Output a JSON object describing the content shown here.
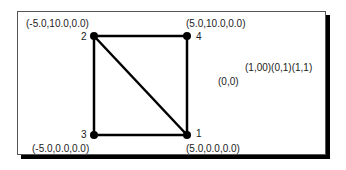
{
  "diagram": {
    "title": "",
    "nodes": [
      {
        "id": "1",
        "label": "1",
        "coords": "(5.0,0.0,0.0)",
        "x": 187,
        "y": 135
      },
      {
        "id": "2",
        "label": "2",
        "coords": "(-5.0,10.0,0.0)",
        "x": 94,
        "y": 36
      },
      {
        "id": "3",
        "label": "3",
        "coords": "(-5.0,0.0,0.0)",
        "x": 94,
        "y": 135
      },
      {
        "id": "4",
        "label": "4",
        "coords": "(5.0,10.0,0.0)",
        "x": 187,
        "y": 36
      }
    ],
    "edges": [
      {
        "from": "2",
        "to": "4"
      },
      {
        "from": "4",
        "to": "1"
      },
      {
        "from": "1",
        "to": "3"
      },
      {
        "from": "3",
        "to": "2"
      },
      {
        "from": "2",
        "to": "1"
      }
    ],
    "uv_labels": {
      "top": "(1,00)(0,1)(1,1)",
      "bottom": "(0,0)"
    },
    "colors": {
      "line": "#000000",
      "text": "#222222",
      "frame_shadow": "#000000"
    }
  }
}
